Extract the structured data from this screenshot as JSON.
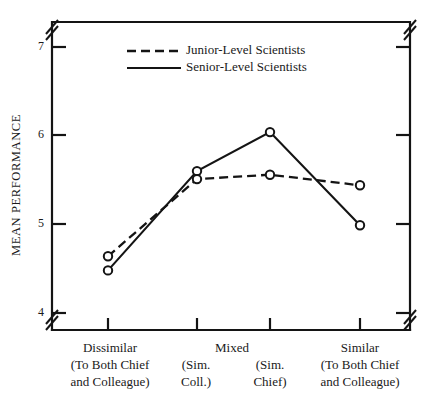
{
  "chart_data": {
    "type": "line",
    "title": "",
    "xlabel": "",
    "ylabel": "MEAN PERFORMANCE",
    "ylim": [
      4,
      7
    ],
    "yticks": [
      4,
      5,
      6,
      7
    ],
    "ytick_labels": [
      "4",
      "5",
      "6",
      "7"
    ],
    "axis_break_y": true,
    "axis_break_x": true,
    "grid": false,
    "legend_position": "top-center",
    "categories": [
      "Dissimilar\n(To Both Chief\nand Colleague)",
      "(Sim.\nColl.)",
      "(Sim.\nChief)",
      "Similar\n(To Both Chief\nand Colleague)"
    ],
    "category_groups": [
      {
        "label": "Mixed",
        "covers": [
          1,
          2
        ]
      }
    ],
    "series": [
      {
        "name": "Junior-Level Scientists",
        "style": "dashed",
        "marker": "open-circle",
        "values": [
          4.64,
          5.51,
          5.56,
          5.44
        ]
      },
      {
        "name": "Senior-Level Scientists",
        "style": "solid",
        "marker": "open-circle",
        "values": [
          4.48,
          5.6,
          6.04,
          4.99
        ]
      }
    ]
  },
  "axis": {
    "y_title": "MEAN PERFORMANCE",
    "tick_7": "7",
    "tick_6": "6",
    "tick_5": "5",
    "tick_4": "4"
  },
  "legend": {
    "junior_label": "Junior-Level Scientists",
    "senior_label": "Senior-Level Scientists"
  },
  "categories": {
    "c1_line1": "Dissimilar",
    "c1_line2": "(To Both Chief",
    "c1_line3": "and Colleague)",
    "mixed_label": "Mixed",
    "c2_line1": "(Sim.",
    "c2_line2": "Coll.)",
    "c3_line1": "(Sim.",
    "c3_line2": "Chief)",
    "c4_line1": "Similar",
    "c4_line2": "(To Both Chief",
    "c4_line3": "and Colleague)"
  },
  "colors": {
    "ink": "#141414",
    "background": "#ffffff"
  }
}
